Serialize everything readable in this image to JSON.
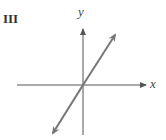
{
  "figure": {
    "panel_label": "III",
    "x_axis_label": "x",
    "y_axis_label": "y",
    "colors": {
      "axes": "#555555",
      "line": "#777777",
      "text": "#333333"
    },
    "line_description": "straight line through origin with positive slope"
  }
}
